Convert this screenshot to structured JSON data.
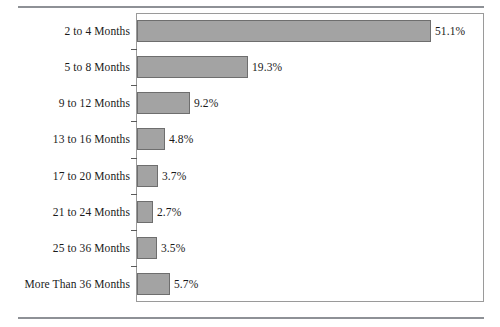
{
  "figure": {
    "background_color": "#ffffff",
    "rule_color": "#8e9196",
    "frame_color": "#9a9a9a",
    "caption_remnant": ""
  },
  "chart_data": {
    "type": "bar",
    "orientation": "horizontal",
    "title": "",
    "subtitle": "",
    "xlabel": "",
    "ylabel": "",
    "categories": [
      "2 to 4 Months",
      "5 to 8 Months",
      "9 to 12 Months",
      "13 to 16 Months",
      "17 to 20 Months",
      "21 to 24 Months",
      "25 to 36 Months",
      "More Than 36 Months"
    ],
    "values": [
      51.1,
      19.3,
      9.2,
      4.8,
      3.7,
      2.7,
      3.5,
      5.7
    ],
    "value_labels": [
      "51.1%",
      "19.3%",
      "9.2%",
      "4.8%",
      "3.7%",
      "2.7%",
      "3.5%",
      "5.7%"
    ],
    "xlim": [
      0,
      60
    ],
    "grid": false,
    "legend": null,
    "bar_fill_color": "#a3a3a3",
    "bar_edge_color": "#6e6e6e",
    "annotations": []
  }
}
